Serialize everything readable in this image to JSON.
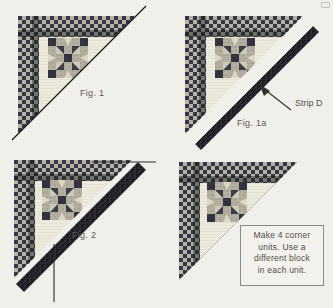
{
  "document": {
    "kind": "quilting-instruction-diagram",
    "background_color": "#f2f0ea"
  },
  "panels": [
    {
      "id": "fig-1",
      "caption": "Fig. 1",
      "description": "Corner unit with checkerboard border and star block, diagonal cutting line drawn"
    },
    {
      "id": "fig-1a",
      "caption": "Fig. 1a",
      "description": "Strip D placed along the diagonal edge of the corner unit",
      "annotation": {
        "label": "Strip D",
        "icon": "arrow-up-left-icon"
      }
    },
    {
      "id": "fig-2",
      "caption": "Fig. 2",
      "description": "Strip sewn and pressed open with trim lines marked"
    },
    {
      "id": "fig-3",
      "caption": "",
      "description": "Finished corner unit with instruction note",
      "note": {
        "lines": [
          "Make 4 corner",
          "units. Use a",
          "different block",
          "in each unit."
        ]
      }
    }
  ],
  "colors": {
    "fabric_dark": "#2f3140",
    "fabric_light": "#c9c3b2",
    "fabric_cream": "#efece1",
    "strip_dark": "#1f1e22",
    "ink": "#4f4d4a",
    "paper": "#f2f0ea"
  }
}
